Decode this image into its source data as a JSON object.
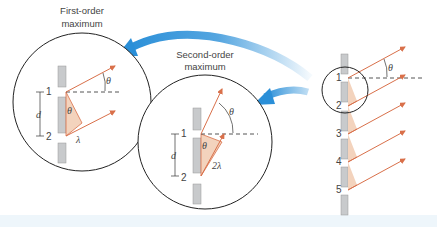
{
  "labels": {
    "first_order_line1": "First-order",
    "first_order_line2": "maximum",
    "second_order_line1": "Second-order",
    "second_order_line2": "maximum"
  },
  "symbols": {
    "theta": "θ",
    "d": "d",
    "lambda": "λ",
    "two_lambda": "2λ"
  },
  "grating": {
    "slit_numbers": [
      "1",
      "2",
      "3",
      "4",
      "5"
    ]
  },
  "inset_first": {
    "slit_top": "1",
    "slit_bottom": "2"
  },
  "inset_second": {
    "slit_top": "1",
    "slit_bottom": "2"
  },
  "colors": {
    "ray": "#d9704a",
    "triangle": "#f3d3bd",
    "slit_block": "#c8cacc",
    "arrow_blue": "#2a8fd8",
    "circle": "#222222"
  }
}
